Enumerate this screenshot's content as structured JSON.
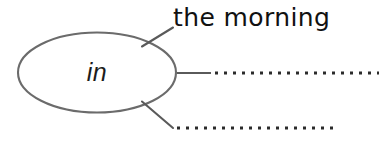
{
  "diagram": {
    "type": "mind-map",
    "title": "in",
    "center_node": {
      "label": "in",
      "shape": "ellipse",
      "stroke_color": "#6b6b6b",
      "fill_color": "#ffffff",
      "text_color": "#1c1c1c",
      "cx": 97,
      "cy": 72.5,
      "rx": 80,
      "ry": 40.5
    },
    "branches": [
      {
        "id": "branch-top",
        "label": "the morning",
        "filled": true,
        "line_style": "solid",
        "direction": "up-right",
        "connector": {
          "x1": 143,
          "y1": 46,
          "x2": 172,
          "y2": 28
        }
      },
      {
        "id": "branch-middle",
        "label": "",
        "filled": false,
        "line_style": "solid-then-dotted",
        "direction": "right",
        "connector": {
          "x1": 177,
          "y1": 73,
          "x2": 211,
          "y2": 73
        },
        "dots": {
          "x_start": 214,
          "x_end": 379,
          "y": 73,
          "spacing": 9,
          "size": 3
        }
      },
      {
        "id": "branch-bottom",
        "label": "",
        "filled": false,
        "line_style": "solid-then-dotted",
        "direction": "down-right",
        "connector": {
          "x1": 143,
          "y1": 102,
          "x2": 172,
          "y2": 128
        },
        "dots": {
          "x_start": 176,
          "x_end": 338,
          "y": 128,
          "spacing": 9,
          "size": 3
        }
      }
    ],
    "colors": {
      "background": "#ffffff",
      "stroke": "#6b6b6b",
      "line": "#5a5a5a",
      "dot": "#2b2b2b",
      "text": "#111111"
    }
  }
}
